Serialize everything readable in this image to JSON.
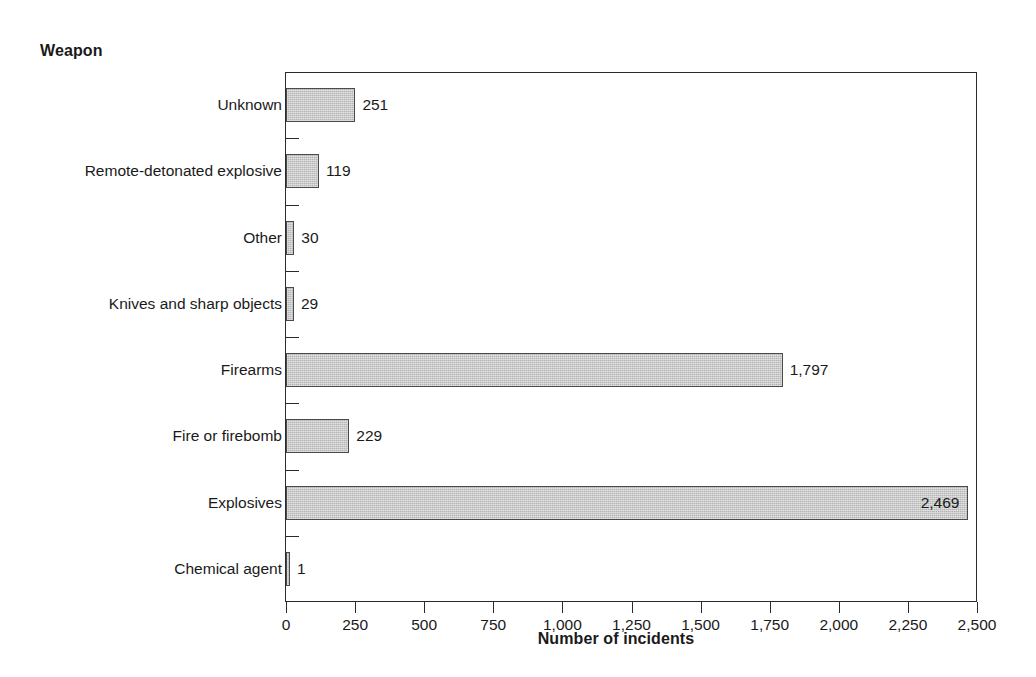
{
  "chart_data": {
    "type": "bar",
    "orientation": "horizontal",
    "title": "",
    "xlabel": "Number of incidents",
    "ylabel": "Weapon",
    "xlim": [
      0,
      2500
    ],
    "xticks": [
      0,
      250,
      500,
      750,
      1000,
      1250,
      1500,
      1750,
      2000,
      2250,
      2500
    ],
    "xtick_labels": [
      "0",
      "250",
      "500",
      "750",
      "1,000",
      "1,250",
      "1,500",
      "1,750",
      "2,000",
      "2,250",
      "2,500"
    ],
    "grid": false,
    "legend": false,
    "bar_color": "#b4b4b4",
    "bar_edge_color": "#4a4a4a",
    "categories": [
      "Unknown",
      "Remote-detonated explosive",
      "Other",
      "Knives and sharp objects",
      "Firearms",
      "Fire or firebomb",
      "Explosives",
      "Chemical agent"
    ],
    "values": [
      251,
      119,
      30,
      29,
      1797,
      229,
      2469,
      1
    ],
    "value_labels": [
      "251",
      "119",
      "30",
      "29",
      "1,797",
      "229",
      "2,469",
      "1"
    ],
    "label_placement": [
      "outside",
      "outside",
      "outside",
      "outside",
      "outside",
      "outside",
      "inside",
      "outside"
    ]
  },
  "axis": {
    "y_title": "Weapon",
    "x_title": "Number of incidents"
  }
}
